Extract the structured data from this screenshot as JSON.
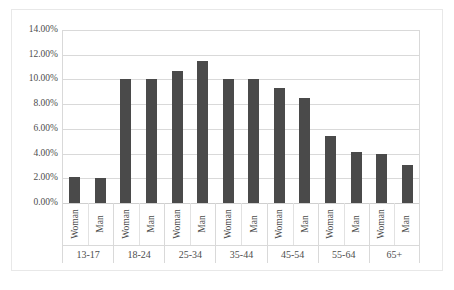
{
  "chart_data": {
    "type": "bar",
    "title": "",
    "subtitle": "",
    "xlabel": "",
    "ylabel": "",
    "ylim": [
      0,
      14
    ],
    "ytick_labels": [
      "14.00%",
      "12.00%",
      "10.00%",
      "8.00%",
      "6.00%",
      "4.00%",
      "2.00%",
      "0.00%"
    ],
    "ytick_values": [
      14,
      12,
      10,
      8,
      6,
      4,
      2,
      0
    ],
    "grid": true,
    "legend": false,
    "legend_position": "none",
    "bar_color": "#4a4a4a",
    "gridline_color": "#d9d9d9",
    "categories": [
      "13-17",
      "18-24",
      "25-34",
      "35-44",
      "45-54",
      "55-64",
      "65+"
    ],
    "subcategories": [
      "Woman",
      "Man"
    ],
    "series": [
      {
        "name": "Woman",
        "values": [
          2.1,
          10.0,
          10.7,
          10.0,
          9.3,
          5.4,
          4.0
        ]
      },
      {
        "name": "Man",
        "values": [
          2.0,
          10.0,
          11.5,
          10.0,
          8.5,
          4.1,
          3.1
        ]
      }
    ],
    "bars": [
      {
        "group": "13-17",
        "sub": "Woman",
        "value": 2.1
      },
      {
        "group": "13-17",
        "sub": "Man",
        "value": 2.0
      },
      {
        "group": "18-24",
        "sub": "Woman",
        "value": 10.0
      },
      {
        "group": "18-24",
        "sub": "Man",
        "value": 10.0
      },
      {
        "group": "25-34",
        "sub": "Woman",
        "value": 10.7
      },
      {
        "group": "25-34",
        "sub": "Man",
        "value": 11.5
      },
      {
        "group": "35-44",
        "sub": "Woman",
        "value": 10.0
      },
      {
        "group": "35-44",
        "sub": "Man",
        "value": 10.0
      },
      {
        "group": "45-54",
        "sub": "Woman",
        "value": 9.3
      },
      {
        "group": "45-54",
        "sub": "Man",
        "value": 8.5
      },
      {
        "group": "55-64",
        "sub": "Woman",
        "value": 5.4
      },
      {
        "group": "55-64",
        "sub": "Man",
        "value": 4.1
      },
      {
        "group": "65+",
        "sub": "Woman",
        "value": 4.0
      },
      {
        "group": "65+",
        "sub": "Man",
        "value": 3.1
      }
    ]
  }
}
